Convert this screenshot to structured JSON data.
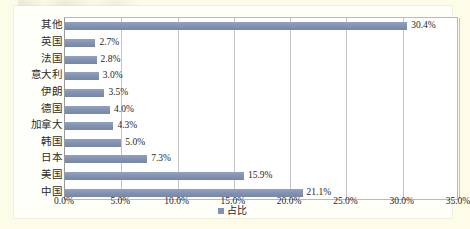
{
  "chart_data": {
    "type": "bar",
    "orientation": "horizontal",
    "title": "",
    "subtitle": "",
    "xlabel": "",
    "ylabel": "",
    "categories": [
      "中国",
      "美国",
      "日本",
      "韩国",
      "加拿大",
      "德国",
      "伊朗",
      "意大利",
      "法国",
      "英国",
      "其他"
    ],
    "values": [
      21.1,
      15.9,
      7.3,
      5.0,
      4.3,
      4.0,
      3.5,
      3.0,
      2.8,
      2.7,
      30.4
    ],
    "value_labels": [
      "21.1%",
      "15.9%",
      "7.3%",
      "5.0%",
      "4.3%",
      "4.0%",
      "3.5%",
      "3.0%",
      "2.8%",
      "2.7%",
      "30.4%"
    ],
    "series": [
      {
        "name": "占比",
        "color": "#8293b3",
        "values": [
          21.1,
          15.9,
          7.3,
          5.0,
          4.3,
          4.0,
          3.5,
          3.0,
          2.8,
          2.7,
          30.4
        ]
      }
    ],
    "xlim": [
      0,
      35
    ],
    "xticks": [
      0,
      5,
      10,
      15,
      20,
      25,
      30,
      35
    ],
    "xtick_labels": [
      "0.0%",
      "5.0%",
      "10.0%",
      "15.0%",
      "20.0%",
      "25.0%",
      "30.0%",
      "35.0%"
    ],
    "grid": "vertical",
    "legend": {
      "position": "bottom",
      "entries": [
        "占比"
      ]
    },
    "colors": {
      "bar": "#8293b3",
      "grid": "#c3c3c3",
      "axis": "#9a9a9a",
      "plot_background": "#ffffff",
      "page_background": "#fdfce9",
      "text": "#262626"
    }
  },
  "legend": {
    "label": "占比"
  },
  "rows": [
    {
      "category": "其他",
      "value_label": "30.4%",
      "value": 30.4
    },
    {
      "category": "英国",
      "value_label": "2.7%",
      "value": 2.7
    },
    {
      "category": "法国",
      "value_label": "2.8%",
      "value": 2.8
    },
    {
      "category": "意大利",
      "value_label": "3.0%",
      "value": 3.0
    },
    {
      "category": "伊朗",
      "value_label": "3.5%",
      "value": 3.5
    },
    {
      "category": "德国",
      "value_label": "4.0%",
      "value": 4.0
    },
    {
      "category": "加拿大",
      "value_label": "4.3%",
      "value": 4.3
    },
    {
      "category": "韩国",
      "value_label": "5.0%",
      "value": 5.0
    },
    {
      "category": "日本",
      "value_label": "7.3%",
      "value": 7.3
    },
    {
      "category": "美国",
      "value_label": "15.9%",
      "value": 15.9
    },
    {
      "category": "中国",
      "value_label": "21.1%",
      "value": 21.1
    }
  ],
  "xticks": [
    {
      "label": "0.0%",
      "value": 0
    },
    {
      "label": "5.0%",
      "value": 5
    },
    {
      "label": "10.0%",
      "value": 10
    },
    {
      "label": "15.0%",
      "value": 15
    },
    {
      "label": "20.0%",
      "value": 20
    },
    {
      "label": "25.0%",
      "value": 25
    },
    {
      "label": "30.0%",
      "value": 30
    },
    {
      "label": "35.0%",
      "value": 35
    }
  ]
}
